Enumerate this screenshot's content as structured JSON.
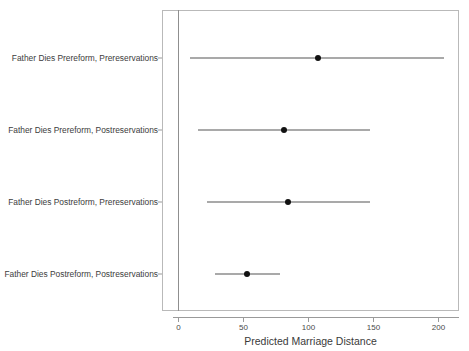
{
  "chart_data": {
    "type": "scatter",
    "title": "",
    "xlabel": "Predicted Marriage Distance",
    "ylabel": "",
    "xlim": [
      -12,
      215
    ],
    "ylim": [
      0,
      4
    ],
    "grid": false,
    "legend": null,
    "xticks": [
      0,
      50,
      100,
      150,
      200
    ],
    "xtick_labels": [
      "0",
      "50",
      "100",
      "150",
      "200"
    ],
    "reference_line": 0,
    "categories": [
      "Father Dies Prereform, Prereservations",
      "Father Dies Prereform, Postreservations",
      "Father Dies Postreform, Prereservations",
      "Father Dies Postreform, Postreservations"
    ],
    "values": [
      107,
      81,
      84,
      53
    ],
    "ci_low": [
      9,
      15,
      22,
      28
    ],
    "ci_high": [
      204,
      147,
      147,
      78
    ],
    "points": [
      {
        "label": "Father Dies Prereform, Prereservations",
        "estimate": 107,
        "ci_low": 9,
        "ci_high": 204
      },
      {
        "label": "Father Dies Prereform, Postreservations",
        "estimate": 81,
        "ci_low": 15,
        "ci_high": 147
      },
      {
        "label": "Father Dies Postreform, Prereservations",
        "estimate": 84,
        "ci_low": 22,
        "ci_high": 147
      },
      {
        "label": "Father Dies Postreform, Postreservations",
        "estimate": 53,
        "ci_low": 28,
        "ci_high": 78
      }
    ],
    "colors": {
      "marker": "#111111",
      "interval": "#555555",
      "frame": "#b9b9b9",
      "axis": "#9a9a9a",
      "reference": "#8f8f8f",
      "text": "#3a3a3a",
      "background": "#ffffff"
    }
  }
}
